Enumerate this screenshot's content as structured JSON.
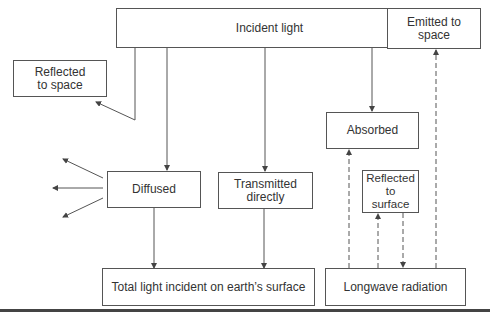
{
  "diagram": {
    "nodes": {
      "incident": "Incident light",
      "reflected_space": "Reflected to space",
      "reflected_space_line1": "Reflected",
      "reflected_space_line2": "to space",
      "emitted": "Emitted to space",
      "emitted_line1": "Emitted to",
      "emitted_line2": "space",
      "absorbed": "Absorbed",
      "diffused": "Diffused",
      "transmitted_line1": "Transmitted",
      "transmitted_line2": "directly",
      "reflected_surface_line1": "Reflected",
      "reflected_surface_line2": "to",
      "reflected_surface_line3": "surface",
      "total": "Total light incident on earth’s surface",
      "longwave": "Longwave radiation"
    },
    "edges": [
      {
        "from": "Incident light",
        "to": "Reflected to space",
        "style": "solid"
      },
      {
        "from": "Incident light",
        "to": "Diffused",
        "style": "solid"
      },
      {
        "from": "Incident light",
        "to": "Transmitted directly",
        "style": "solid"
      },
      {
        "from": "Incident light",
        "to": "Absorbed",
        "style": "solid"
      },
      {
        "from": "Diffused",
        "to": "scattered (3 directions)",
        "style": "solid"
      },
      {
        "from": "Diffused",
        "to": "Total light incident on earth’s surface",
        "style": "solid"
      },
      {
        "from": "Transmitted directly",
        "to": "Total light incident on earth’s surface",
        "style": "solid"
      },
      {
        "from": "Longwave radiation",
        "to": "Absorbed",
        "style": "dashed"
      },
      {
        "from": "Longwave radiation",
        "to": "Reflected to surface",
        "style": "dashed"
      },
      {
        "from": "Reflected to surface",
        "to": "Longwave radiation",
        "style": "dashed"
      },
      {
        "from": "Longwave radiation",
        "to": "Emitted to space",
        "style": "dashed"
      }
    ]
  }
}
